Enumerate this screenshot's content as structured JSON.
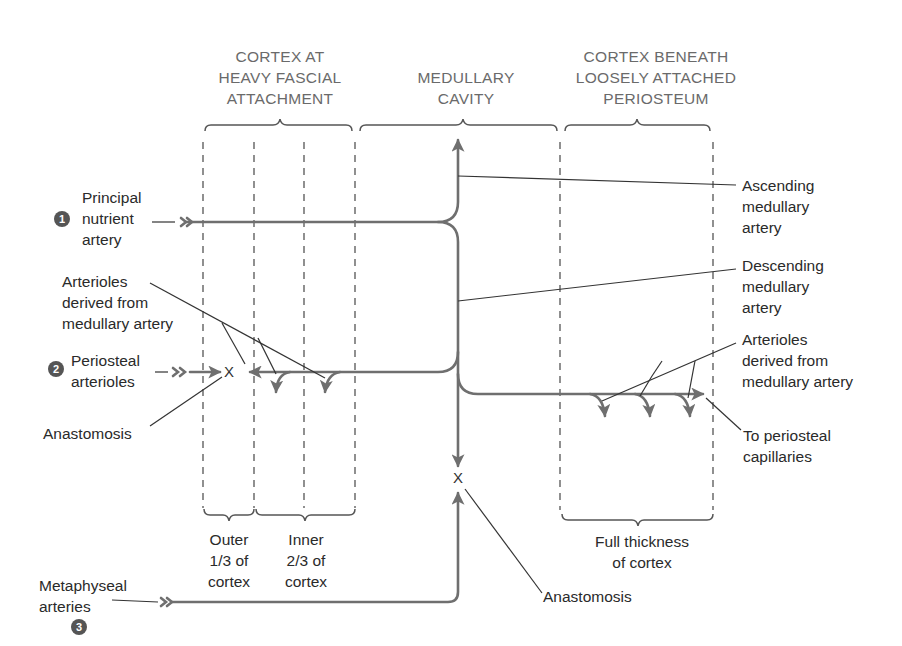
{
  "headers": {
    "left_cortex": [
      "CORTEX AT",
      "HEAVY FASCIAL",
      "ATTACHMENT"
    ],
    "medullary": [
      "MEDULLARY",
      "CAVITY"
    ],
    "right_cortex": [
      "CORTEX BENEATH",
      "LOOSELY ATTACHED",
      "PERIOSTEUM"
    ]
  },
  "left_labels": {
    "principal": {
      "number": "1",
      "lines": [
        "Principal",
        "nutrient",
        "artery"
      ]
    },
    "arterioles_left": {
      "lines": [
        "Arterioles",
        "derived from",
        "medullary artery"
      ]
    },
    "periosteal": {
      "number": "2",
      "lines": [
        "Periosteal",
        "arterioles"
      ]
    },
    "anastomosis_left": {
      "lines": [
        "Anastomosis"
      ]
    },
    "metaphyseal": {
      "number": "3",
      "lines": [
        "Metaphyseal",
        "arteries"
      ]
    }
  },
  "right_labels": {
    "ascending": {
      "lines": [
        "Ascending",
        "medullary",
        "artery"
      ]
    },
    "descending": {
      "lines": [
        "Descending",
        "medullary",
        "artery"
      ]
    },
    "arterioles_right": {
      "lines": [
        "Arterioles",
        "derived from",
        "medullary artery"
      ]
    },
    "to_periosteal": {
      "lines": [
        "To periosteal",
        "capillaries"
      ]
    }
  },
  "bottom_labels": {
    "outer": [
      "Outer",
      "1/3 of",
      "cortex"
    ],
    "inner": [
      "Inner",
      "2/3 of",
      "cortex"
    ],
    "full": [
      "Full thickness",
      "of cortex"
    ],
    "anastomosis_center": [
      "Anastomosis"
    ]
  },
  "markers": {
    "anastomosis_symbol": "X"
  },
  "colors": {
    "artery": "#6f6f6f",
    "leader": "#333333",
    "header_text": "#6a6a6a",
    "label_text": "#2a2a2a",
    "number_circle": "#555555"
  }
}
